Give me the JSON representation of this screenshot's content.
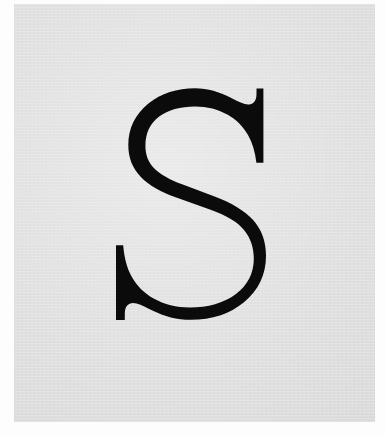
{
  "image": {
    "kind": "letterform-specimen",
    "width_px": 385,
    "height_px": 436,
    "alt_text": "Large black serif capital letter S on a light gray plate"
  },
  "paper": {
    "border_color": "#fdfdfd",
    "border_left_px": 14,
    "border_top_px": 4,
    "border_right_px": 10,
    "border_bottom_px": 14
  },
  "plate": {
    "background_color": "#dddddd",
    "texture": "scanned paper grain",
    "width_px": 361,
    "height_px": 418
  },
  "glyph": {
    "character": "S",
    "case": "uppercase",
    "typeface_style": "didone-modern-serif",
    "color": "#0b0b0b",
    "bounds": {
      "left_px": 128,
      "top_px": 88,
      "right_px": 265,
      "bottom_px": 320,
      "width_px": 137,
      "height_px": 232
    },
    "features": {
      "stroke_contrast": "high",
      "terminals": "flat vertical serifs with concave brackets",
      "spine": "thick diagonal",
      "axis": "vertical"
    }
  }
}
